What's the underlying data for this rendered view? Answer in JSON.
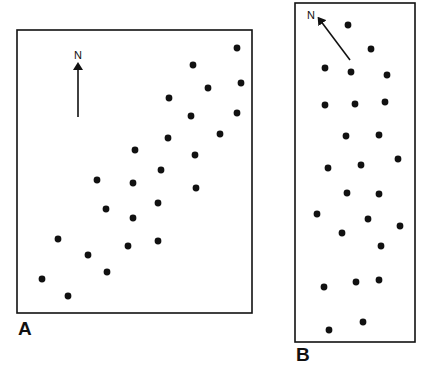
{
  "figure": {
    "colors": {
      "ink": "#111111",
      "background": "#ffffff"
    },
    "panels": [
      {
        "id": "A",
        "label": "A",
        "north_label": "N",
        "north_arrow": {
          "from": [
            78,
            117
          ],
          "to": [
            78,
            66
          ]
        },
        "frame": {
          "x": 17,
          "y": 30,
          "w": 235,
          "h": 283
        },
        "dots": [
          [
            237,
            48
          ],
          [
            193,
            65
          ],
          [
            241,
            83
          ],
          [
            208,
            88
          ],
          [
            169,
            98
          ],
          [
            191,
            116
          ],
          [
            237,
            113
          ],
          [
            220,
            134
          ],
          [
            168,
            138
          ],
          [
            135,
            150
          ],
          [
            195,
            155
          ],
          [
            161,
            170
          ],
          [
            97,
            180
          ],
          [
            133,
            183
          ],
          [
            196,
            188
          ],
          [
            158,
            203
          ],
          [
            106,
            209
          ],
          [
            133,
            218
          ],
          [
            58,
            239
          ],
          [
            158,
            241
          ],
          [
            128,
            246
          ],
          [
            88,
            255
          ],
          [
            107,
            272
          ],
          [
            42,
            279
          ],
          [
            68,
            296
          ]
        ]
      },
      {
        "id": "B",
        "label": "B",
        "north_label": "N",
        "north_arrow": {
          "from": [
            350,
            60
          ],
          "to": [
            320,
            20
          ]
        },
        "frame": {
          "x": 295,
          "y": 3,
          "w": 120,
          "h": 339
        },
        "dots": [
          [
            348,
            25
          ],
          [
            371,
            49
          ],
          [
            325,
            68
          ],
          [
            351,
            72
          ],
          [
            387,
            75
          ],
          [
            325,
            105
          ],
          [
            355,
            104
          ],
          [
            385,
            102
          ],
          [
            346,
            136
          ],
          [
            379,
            135
          ],
          [
            398,
            159
          ],
          [
            328,
            168
          ],
          [
            361,
            165
          ],
          [
            347,
            193
          ],
          [
            379,
            194
          ],
          [
            317,
            214
          ],
          [
            368,
            219
          ],
          [
            400,
            226
          ],
          [
            342,
            233
          ],
          [
            381,
            246
          ],
          [
            324,
            287
          ],
          [
            356,
            282
          ],
          [
            379,
            280
          ],
          [
            329,
            330
          ],
          [
            363,
            322
          ]
        ]
      }
    ]
  }
}
